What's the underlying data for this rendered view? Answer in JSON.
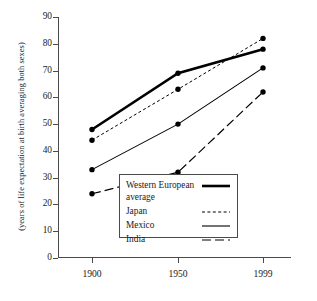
{
  "chart_data": {
    "type": "line",
    "title": "",
    "xlabel": "",
    "ylabel": "(years of life expectation at birth averaging both sexes)",
    "categories": [
      "1900",
      "1950",
      "1999"
    ],
    "x": [
      1900,
      1950,
      1999
    ],
    "xlim": [
      1880,
      2015
    ],
    "ylim": [
      0,
      90
    ],
    "yticks": [
      0,
      10,
      20,
      30,
      40,
      50,
      60,
      70,
      80,
      90
    ],
    "xticks": [
      "1900",
      "1950",
      "1999"
    ],
    "grid": false,
    "legend_position": "inside-bottom-right",
    "series": [
      {
        "name": "Western European average",
        "values": [
          48,
          69,
          78
        ],
        "style": "thick-solid",
        "color": "#000000"
      },
      {
        "name": "Japan",
        "values": [
          44,
          63,
          82
        ],
        "style": "fine-dotted",
        "color": "#000000"
      },
      {
        "name": "Mexico",
        "values": [
          33,
          50,
          71
        ],
        "style": "thin-solid",
        "color": "#000000"
      },
      {
        "name": "India",
        "values": [
          24,
          32,
          62
        ],
        "style": "long-dashed",
        "color": "#000000"
      }
    ]
  },
  "axis": {
    "ylabel": "(years of life expectation at birth averaging both sexes)",
    "ytick_labels": [
      "90",
      "80",
      "70",
      "60",
      "50",
      "40",
      "30",
      "20",
      "10",
      "0"
    ],
    "xtick_labels": [
      "1900",
      "1950",
      "1999"
    ]
  },
  "legend": {
    "entries": [
      {
        "label": "Western European",
        "label2": "average",
        "style": "thick-solid"
      },
      {
        "label": "Japan",
        "style": "fine-dotted"
      },
      {
        "label": "Mexico",
        "style": "thin-solid"
      },
      {
        "label": "India",
        "style": "long-dashed"
      }
    ]
  }
}
